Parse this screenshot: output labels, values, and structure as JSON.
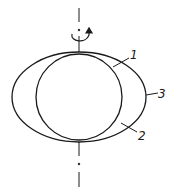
{
  "diagram": {
    "labels": [
      {
        "id": "1",
        "text": "1",
        "target": "circle outline (sphere)"
      },
      {
        "id": "2",
        "text": "2",
        "target": "region between sphere and ellipsoid"
      },
      {
        "id": "3",
        "text": "3",
        "target": "ellipse outline (ellipsoid)"
      }
    ],
    "axis": {
      "style": "dash-dot",
      "orientation": "vertical"
    },
    "rotation_indicator": {
      "icon": "rotation-arrow-icon",
      "direction": "counter-clockwise"
    },
    "colors": {
      "stroke": "#1a1a1a",
      "background": "#ffffff"
    }
  }
}
